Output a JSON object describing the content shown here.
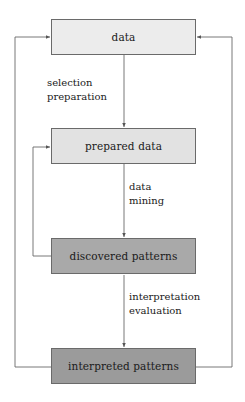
{
  "diagram": {
    "type": "process-flow",
    "nodes": [
      {
        "id": "data",
        "label": "data",
        "fill": "#ececec"
      },
      {
        "id": "prepared",
        "label": "prepared data",
        "fill": "#e2e2e2"
      },
      {
        "id": "discovered",
        "label": "discovered patterns",
        "fill": "#a9a9a9"
      },
      {
        "id": "interpreted",
        "label": "interpreted patterns",
        "fill": "#9b9b9b"
      }
    ],
    "edges": [
      {
        "from": "data",
        "to": "prepared",
        "label_lines": [
          "selection",
          "preparation"
        ]
      },
      {
        "from": "prepared",
        "to": "discovered",
        "label_lines": [
          "data",
          "mining"
        ]
      },
      {
        "from": "discovered",
        "to": "interpreted",
        "label_lines": [
          "interpretation",
          "evaluation"
        ]
      },
      {
        "from": "discovered",
        "to": "prepared",
        "label_lines": [],
        "route": "inner-left-loop"
      },
      {
        "from": "interpreted",
        "to": "data",
        "label_lines": [],
        "route": "outer-left-loop"
      },
      {
        "from": "interpreted",
        "to": "data",
        "label_lines": [],
        "route": "outer-right-loop"
      }
    ],
    "colors": {
      "line": "#6a6a6a",
      "text": "#1a1a1a"
    }
  }
}
